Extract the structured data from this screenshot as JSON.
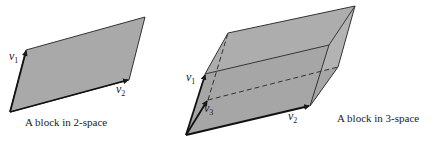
{
  "figures": [
    {
      "id": "block-2d",
      "caption": "A block in 2-space",
      "vectors": [
        {
          "name": "v",
          "sub": "1"
        },
        {
          "name": "v",
          "sub": "2"
        }
      ]
    },
    {
      "id": "block-3d",
      "caption": "A block in 3-space",
      "vectors": [
        {
          "name": "v",
          "sub": "1"
        },
        {
          "name": "v",
          "sub": "3"
        },
        {
          "name": "v",
          "sub": "2"
        }
      ]
    }
  ],
  "colors": {
    "fill": "#a9a9a9",
    "fill_side": "#b5b5b5",
    "edge": "#2a2a2a",
    "background": "#ffffff"
  }
}
